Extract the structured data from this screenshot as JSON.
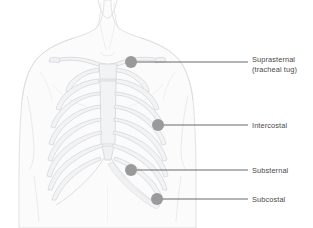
{
  "figure": {
    "width": 313,
    "height": 228,
    "background_color": "#ffffff"
  },
  "style": {
    "marker_color": "#9a9a9a",
    "marker_radius": 6,
    "leader_color": "#4f4f4f",
    "label_color": "#4a4a4a",
    "body_line_color": "#dcdee0",
    "bone_line_color": "#d3d6d9",
    "bone_fill_color": "#f2f3f4",
    "body_fill_color": "#fbfbfc"
  },
  "markers": [
    {
      "id": "suprasternal",
      "label_line1": "Suprasternal",
      "label_line2": "(tracheal tug)",
      "dot_x": 131,
      "dot_y": 62,
      "leader_y": 62,
      "leader_end_x": 248,
      "label_x": 252,
      "label_y": 55
    },
    {
      "id": "intercostal",
      "label_line1": "Intercostal",
      "label_line2": "",
      "dot_x": 158,
      "dot_y": 125,
      "leader_y": 125,
      "leader_end_x": 248,
      "label_x": 252,
      "label_y": 121
    },
    {
      "id": "substernal",
      "label_line1": "Substernal",
      "label_line2": "",
      "dot_x": 131,
      "dot_y": 170,
      "leader_y": 170,
      "leader_end_x": 248,
      "label_x": 252,
      "label_y": 166
    },
    {
      "id": "subcostal",
      "label_line1": "Subcostal",
      "label_line2": "",
      "dot_x": 157,
      "dot_y": 199,
      "leader_y": 199,
      "leader_end_x": 248,
      "label_x": 252,
      "label_y": 195
    }
  ]
}
